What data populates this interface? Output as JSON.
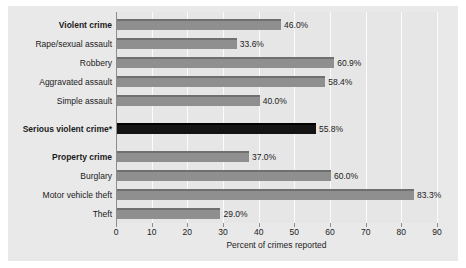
{
  "chart_data": {
    "type": "bar",
    "orientation": "horizontal",
    "title": "",
    "xlabel": "Percent of crimes reported",
    "ylabel": "",
    "xlim": [
      0,
      90
    ],
    "xticks": [
      "0",
      "10",
      "20",
      "30",
      "40",
      "50",
      "60",
      "70",
      "80",
      "90"
    ],
    "grid": true,
    "legend": "none",
    "categories": [
      "Violent crime",
      "Rape/sexual assault",
      "Robbery",
      "Aggravated assault",
      "Simple assault",
      "Serious violent crime*",
      "Property crime",
      "Burglary",
      "Motor vehicle theft",
      "Theft"
    ],
    "values": [
      46.0,
      33.6,
      60.9,
      58.4,
      40.0,
      55.8,
      37.0,
      60.0,
      83.3,
      29.0
    ],
    "value_labels": [
      "46.0%",
      "33.6%",
      "60.9%",
      "58.4%",
      "40.0%",
      "55.8%",
      "37.0%",
      "60.0%",
      "83.3%",
      "29.0%"
    ],
    "bold_categories": [
      "Violent crime",
      "Serious violent crime*",
      "Property crime"
    ],
    "bar_colors": [
      "#8f8f8f",
      "#8f8f8f",
      "#8f8f8f",
      "#8f8f8f",
      "#8f8f8f",
      "#141414",
      "#8f8f8f",
      "#8f8f8f",
      "#8f8f8f",
      "#8f8f8f"
    ],
    "colors": {
      "bar_default": "#8f8f8f",
      "bar_highlight": "#141414",
      "plot_background": "#e6e6e6",
      "figure_background": "#e9e9e9",
      "gridline": "#fbfbfb",
      "axis": "#8d8d8d",
      "text": "#1b1b1b"
    }
  }
}
